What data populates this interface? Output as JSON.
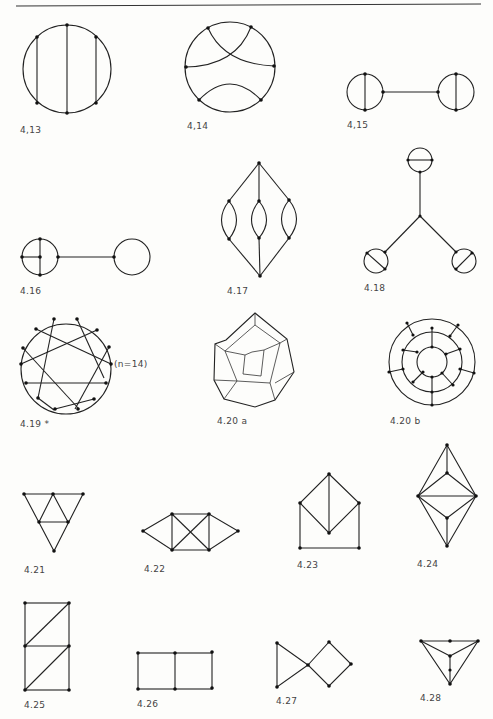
{
  "page": {
    "header_rule": true,
    "figures": [
      {
        "id": "4.13",
        "label": "4,13",
        "kind": "circle-with-three-chords"
      },
      {
        "id": "4.14",
        "label": "4,14",
        "kind": "circle-with-crossing-arcs"
      },
      {
        "id": "4.15",
        "label": "4,15",
        "kind": "two-theta-graphs-bridged"
      },
      {
        "id": "4.16",
        "label": "4.16",
        "kind": "wheel-and-circle-bridged"
      },
      {
        "id": "4.17",
        "label": "4.17",
        "kind": "diamond-with-three-lenses"
      },
      {
        "id": "4.18",
        "label": "4.18",
        "kind": "star-with-three-theta-graphs"
      },
      {
        "id": "4.19",
        "label": "4.19 *",
        "kind": "circulant-graph",
        "annotation": "(n=14)"
      },
      {
        "id": "4.20a",
        "label": "4.20 a",
        "kind": "dodecahedron"
      },
      {
        "id": "4.20b",
        "label": "4.20 b",
        "kind": "three-concentric-circles"
      },
      {
        "id": "4.21",
        "label": "4.21",
        "kind": "triangle-subdivided"
      },
      {
        "id": "4.22",
        "label": "4.22",
        "kind": "square-with-diagonals-and-wings"
      },
      {
        "id": "4.23",
        "label": "4.23",
        "kind": "house-with-diamond"
      },
      {
        "id": "4.24",
        "label": "4.24",
        "kind": "double-pyramid"
      },
      {
        "id": "4.25",
        "label": "4.25",
        "kind": "ladder-with-diagonals"
      },
      {
        "id": "4.26",
        "label": "4.26",
        "kind": "two-squares"
      },
      {
        "id": "4.27",
        "label": "4.27",
        "kind": "bowtie-triangle-square"
      },
      {
        "id": "4.28",
        "label": "4.28",
        "kind": "triangle-with-center"
      }
    ]
  }
}
